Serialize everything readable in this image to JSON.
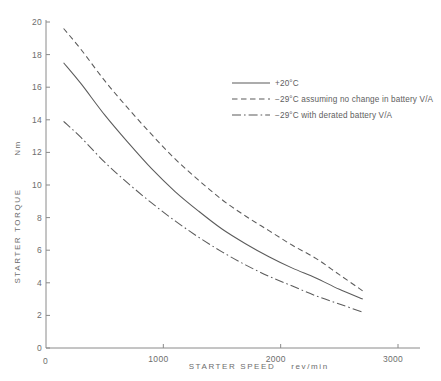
{
  "chart_data": {
    "type": "line",
    "title": "",
    "xlabel": "STARTER SPEED   rev/min",
    "ylabel": "STARTER TORQUE   Nm",
    "xlim": [
      0,
      3000
    ],
    "ylim": [
      0,
      20
    ],
    "grid": false,
    "legend_position": "upper-right",
    "xticks": [
      0,
      1000,
      2000,
      3000
    ],
    "xticklabels": [
      "0",
      "1000",
      "2000",
      "3000"
    ],
    "yticks": [
      0,
      2,
      4,
      6,
      8,
      10,
      12,
      14,
      16,
      18,
      20
    ],
    "yticklabels": [
      "0",
      "2",
      "4",
      "6",
      "8",
      "10",
      "12",
      "14",
      "16",
      "18",
      "20"
    ],
    "y_axis_label_text": "STARTER TORQUE",
    "y_axis_unit_text": "Nm",
    "x_axis_label_text": "STARTER SPEED",
    "x_axis_unit_text": "rev/min",
    "x_origin_label": "0",
    "series": [
      {
        "name": "+20°C",
        "style": "solid",
        "color": "#5b5b5b",
        "x": [
          150,
          300,
          500,
          700,
          900,
          1100,
          1300,
          1500,
          1700,
          1900,
          2100,
          2300,
          2500,
          2700
        ],
        "y": [
          17.5,
          16.2,
          14.3,
          12.6,
          11.0,
          9.6,
          8.4,
          7.3,
          6.4,
          5.6,
          4.9,
          4.3,
          3.6,
          3.0
        ]
      },
      {
        "name": "−29°C assuming no change in battery V/A",
        "style": "dashed",
        "color": "#5b5b5b",
        "x": [
          150,
          300,
          500,
          700,
          900,
          1100,
          1300,
          1500,
          1700,
          1900,
          2100,
          2300,
          2500,
          2700
        ],
        "y": [
          19.6,
          18.3,
          16.4,
          14.7,
          13.1,
          11.6,
          10.3,
          9.1,
          8.1,
          7.2,
          6.3,
          5.5,
          4.5,
          3.5
        ]
      },
      {
        "name": "−29°C with derated battery V/A",
        "style": "dashdot",
        "color": "#5b5b5b",
        "x": [
          150,
          300,
          500,
          700,
          900,
          1100,
          1300,
          1500,
          1700,
          1900,
          2100,
          2300,
          2500,
          2700
        ],
        "y": [
          13.9,
          12.9,
          11.4,
          10.1,
          8.9,
          7.8,
          6.8,
          5.9,
          5.1,
          4.4,
          3.8,
          3.2,
          2.7,
          2.2
        ]
      }
    ]
  },
  "legend": {
    "entries": [
      {
        "label": "+20°C",
        "style": "solid"
      },
      {
        "label": "−29°C assuming no change in battery V/A",
        "style": "dashed"
      },
      {
        "label": "−29°C with derated battery V/A",
        "style": "dashdot"
      }
    ]
  },
  "colors": {
    "background": "#ffffff",
    "axis": "#8a8a8a",
    "curve": "#5b5b5b",
    "text": "#6d6d6d"
  }
}
